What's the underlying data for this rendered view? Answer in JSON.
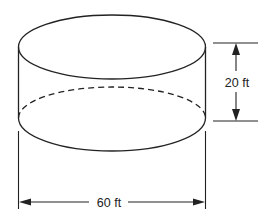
{
  "diagram": {
    "type": "cylinder-dimension-drawing",
    "shape": "cylinder",
    "stroke_color": "#222222",
    "background_color": "#ffffff",
    "dimensions": {
      "height": {
        "label": "20 ft",
        "value": 20,
        "unit": "ft"
      },
      "diameter": {
        "label": "60 ft",
        "value": 60,
        "unit": "ft"
      }
    }
  }
}
